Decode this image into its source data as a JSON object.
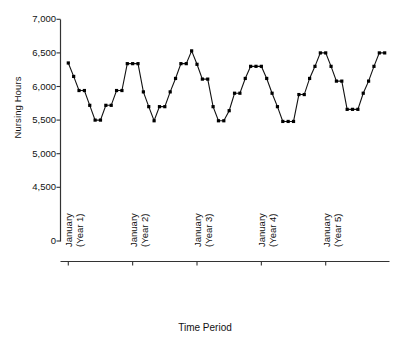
{
  "chart_data": {
    "type": "line",
    "title": "",
    "xlabel": "Time Period",
    "ylabel": "Nursing Hours",
    "ylim": [
      0,
      7000
    ],
    "ytick_labels": [
      "7,000",
      "6,500",
      "6,000",
      "5,500",
      "5,000",
      "4,500",
      "0"
    ],
    "ytick_values": [
      7000,
      6500,
      6000,
      5500,
      5000,
      4500,
      0
    ],
    "axis_break": true,
    "grid": false,
    "legend": "none",
    "marker": "filled-square",
    "xtick_labels": [
      {
        "month": "January",
        "year": "(Year 1)"
      },
      {
        "month": "January",
        "year": "(Year 2)"
      },
      {
        "month": "January",
        "year": "(Year 3)"
      },
      {
        "month": "January",
        "year": "(Year 4)"
      },
      {
        "month": "January",
        "year": "(Year 5)"
      }
    ],
    "xtick_indices": [
      0,
      12,
      24,
      36,
      48
    ],
    "x": [
      0,
      1,
      2,
      3,
      4,
      5,
      6,
      7,
      8,
      9,
      10,
      11,
      12,
      13,
      14,
      15,
      16,
      17,
      18,
      19,
      20,
      21,
      22,
      23,
      24,
      25,
      26,
      27,
      28,
      29,
      30,
      31,
      32,
      33,
      34,
      35,
      36,
      37,
      38,
      39,
      40,
      41,
      42,
      43,
      44,
      45,
      46,
      47,
      48,
      49,
      50,
      51,
      52,
      53,
      54,
      55,
      56,
      57,
      58,
      59
    ],
    "values": [
      6350,
      6150,
      5940,
      5940,
      5720,
      5500,
      5500,
      5720,
      5720,
      5940,
      5940,
      6340,
      6340,
      6340,
      5920,
      5700,
      5490,
      5700,
      5700,
      5920,
      6120,
      6340,
      6340,
      6530,
      6330,
      6110,
      6110,
      5700,
      5490,
      5490,
      5640,
      5900,
      5900,
      6120,
      6300,
      6300,
      6300,
      6120,
      5900,
      5700,
      5480,
      5480,
      5480,
      5880,
      5880,
      6120,
      6300,
      6500,
      6500,
      6300,
      6080,
      6080,
      5660,
      5660,
      5660,
      5900,
      6080,
      6300,
      6500,
      6500
    ],
    "colors": {
      "line": "#111111",
      "marker": "#000000",
      "axis": "#333333",
      "background": "#ffffff"
    }
  }
}
